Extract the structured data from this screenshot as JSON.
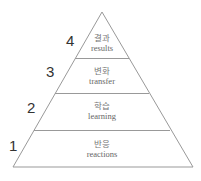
{
  "diagram": {
    "type": "pyramid",
    "line_color": "#999999",
    "levels": [
      {
        "number": "4",
        "korean": "결과",
        "english": "results"
      },
      {
        "number": "3",
        "korean": "변화",
        "english": "transfer"
      },
      {
        "number": "2",
        "korean": "학습",
        "english": "learning"
      },
      {
        "number": "1",
        "korean": "반응",
        "english": "reactions"
      }
    ]
  }
}
